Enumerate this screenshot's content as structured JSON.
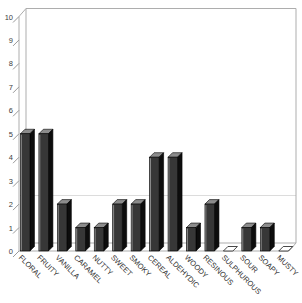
{
  "chart_data": {
    "type": "bar",
    "title": "",
    "categories": [
      "FLORAL",
      "FRUITY",
      "VANILLA",
      "CARAMEL",
      "NUTTY",
      "SWEET",
      "SMOKY",
      "CEREAL",
      "ALDEHYDIC",
      "WOODY",
      "RESINOUS",
      "SULPHUROUS",
      "SOUR",
      "SOAPY",
      "MUSTY"
    ],
    "values": [
      5,
      5,
      2,
      1,
      1,
      2,
      2,
      4,
      4,
      1,
      2,
      0,
      1,
      1,
      0
    ],
    "ylim": [
      0,
      10
    ],
    "yticks": [
      "0",
      "1",
      "2",
      "3",
      "4",
      "5",
      "6",
      "7",
      "8",
      "9",
      "10"
    ],
    "grid": false,
    "legend": null,
    "style_3d": true,
    "colors": {
      "bar_front": "#373737",
      "bar_top": "#8c8c8c",
      "bar_side": "#0d0d0d",
      "bar_outline": "#000000",
      "bar_highlight": "#9e9e9e",
      "zero_marker_fill": "#ffffff",
      "zero_marker_outline": "#1a1a1a",
      "frame": "#adadad",
      "tick": "#9a9a9a",
      "faint_line": "#dcdcdc",
      "axis_text": "#3d3d3d",
      "category_text": "#333333",
      "background": "#ffffff"
    }
  }
}
